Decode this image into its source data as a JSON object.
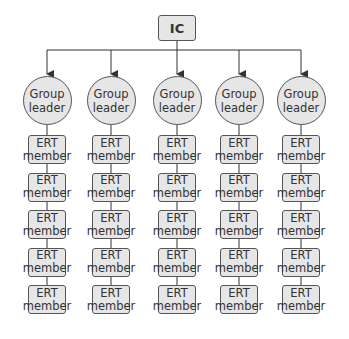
{
  "top": {
    "label": "IC"
  },
  "columns": [
    {
      "leader": {
        "line1": "Group",
        "line2": "leader"
      },
      "members": [
        {
          "line1": "ERT",
          "line2": "member"
        },
        {
          "line1": "ERT",
          "line2": "member"
        },
        {
          "line1": "ERT",
          "line2": "member"
        },
        {
          "line1": "ERT",
          "line2": "member"
        },
        {
          "line1": "ERT",
          "line2": "member"
        }
      ]
    },
    {
      "leader": {
        "line1": "Group",
        "line2": "leader"
      },
      "members": [
        {
          "line1": "ERT",
          "line2": "member"
        },
        {
          "line1": "ERT",
          "line2": "member"
        },
        {
          "line1": "ERT",
          "line2": "member"
        },
        {
          "line1": "ERT",
          "line2": "member"
        },
        {
          "line1": "ERT",
          "line2": "member"
        }
      ]
    },
    {
      "leader": {
        "line1": "Group",
        "line2": "leader"
      },
      "members": [
        {
          "line1": "ERT",
          "line2": "member"
        },
        {
          "line1": "ERT",
          "line2": "member"
        },
        {
          "line1": "ERT",
          "line2": "member"
        },
        {
          "line1": "ERT",
          "line2": "member"
        },
        {
          "line1": "ERT",
          "line2": "member"
        }
      ]
    },
    {
      "leader": {
        "line1": "Group",
        "line2": "leader"
      },
      "members": [
        {
          "line1": "ERT",
          "line2": "member"
        },
        {
          "line1": "ERT",
          "line2": "member"
        },
        {
          "line1": "ERT",
          "line2": "member"
        },
        {
          "line1": "ERT",
          "line2": "member"
        },
        {
          "line1": "ERT",
          "line2": "member"
        }
      ]
    },
    {
      "leader": {
        "line1": "Group",
        "line2": "leader"
      },
      "members": [
        {
          "line1": "ERT",
          "line2": "member"
        },
        {
          "line1": "ERT",
          "line2": "member"
        },
        {
          "line1": "ERT",
          "line2": "member"
        },
        {
          "line1": "ERT",
          "line2": "member"
        },
        {
          "line1": "ERT",
          "line2": "member"
        }
      ]
    }
  ],
  "colors": {
    "node_fill": "#e6e6e6",
    "stroke": "#555555"
  }
}
